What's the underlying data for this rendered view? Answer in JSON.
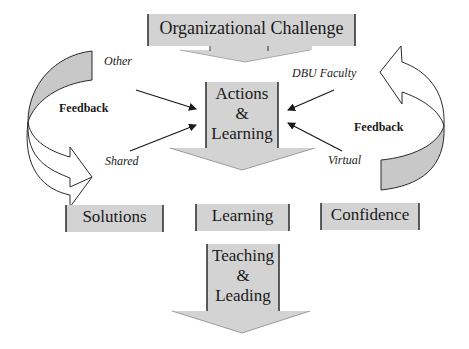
{
  "diagram": {
    "top_box": {
      "label": "Organizational Challenge"
    },
    "center_arrow": {
      "lines": [
        "Actions",
        "&",
        "Learning"
      ]
    },
    "inputs": {
      "top_left": "Other",
      "bottom_left": "Shared",
      "top_right": "DBU Faculty",
      "bottom_right": "Virtual"
    },
    "feedback_left": "Feedback",
    "feedback_right": "Feedback",
    "outcomes": [
      {
        "label": "Solutions"
      },
      {
        "label": "Learning"
      },
      {
        "label": "Confidence"
      }
    ],
    "bottom_arrow": {
      "lines": [
        "Teaching",
        "&",
        "Leading"
      ]
    },
    "colors": {
      "fill": "#d3d3d3",
      "stroke": "#2a2a2a",
      "background": "#ffffff"
    }
  }
}
